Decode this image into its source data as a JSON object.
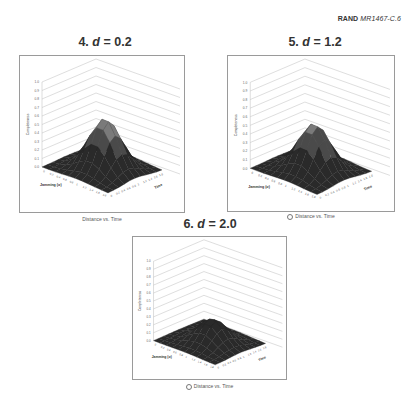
{
  "header": {
    "org": "RAND",
    "doc_id": "MR1467-C.6"
  },
  "panels": [
    {
      "number": "4.",
      "var": "d",
      "eq": " = 0.2",
      "caption": "Distance vs. Time",
      "caption_marker": false
    },
    {
      "number": "5.",
      "var": "d",
      "eq": " = 1.2",
      "caption": "Distance vs. Time",
      "caption_marker": true
    },
    {
      "number": "6.",
      "var": "d",
      "eq": " = 2.0",
      "caption": "Distance vs. Time",
      "caption_marker": true
    }
  ],
  "chart_data": [
    {
      "type": "surface3d",
      "title": "4. d = 0.2",
      "zlabel": "Completeness",
      "xlabel": "Jamming (σ)",
      "ylabel": "Time",
      "legend": "Distance vs. Time",
      "z_ticks": [
        0,
        0.1,
        0.2,
        0.3,
        0.4,
        0.5,
        0.6,
        0.7,
        0.8,
        0.9,
        1
      ],
      "x_ticks": [
        0,
        0.2,
        0.4,
        0.6,
        0.8,
        1,
        1.2,
        1.4,
        1.6,
        1.8
      ],
      "y_ticks": [
        0,
        0.2,
        0.4,
        0.6,
        0.8,
        1,
        1.2,
        1.4,
        1.6,
        1.8
      ],
      "zlim": [
        0,
        1
      ],
      "peak_z": 0.6,
      "shape": "single gaussian-like hill centered mid-domain"
    },
    {
      "type": "surface3d",
      "title": "5. d = 1.2",
      "zlabel": "Completeness",
      "xlabel": "Jamming (σ)",
      "ylabel": "Time",
      "legend": "Distance vs. Time",
      "z_ticks": [
        0,
        0.1,
        0.2,
        0.3,
        0.4,
        0.5,
        0.6,
        0.7,
        0.8,
        0.9,
        1
      ],
      "x_ticks": [
        0,
        0.2,
        0.4,
        0.6,
        0.8,
        1,
        1.2,
        1.4,
        1.6,
        1.8
      ],
      "y_ticks": [
        0,
        0.2,
        0.4,
        0.6,
        0.8,
        1,
        1.2,
        1.4,
        1.6,
        1.8
      ],
      "zlim": [
        0,
        1
      ],
      "peak_z": 0.55,
      "shape": "single gaussian-like hill centered mid-domain"
    },
    {
      "type": "surface3d",
      "title": "6. d = 2.0",
      "zlabel": "Completeness",
      "xlabel": "Jamming (σ)",
      "ylabel": "Time",
      "legend": "Distance vs. Time",
      "z_ticks": [
        0,
        0.1,
        0.2,
        0.3,
        0.4,
        0.5,
        0.6,
        0.7,
        0.8,
        0.9,
        1
      ],
      "x_ticks": [
        0,
        0.2,
        0.4,
        0.6,
        0.8,
        1,
        1.2,
        1.4,
        1.6,
        1.8
      ],
      "y_ticks": [
        0,
        0.2,
        0.4,
        0.6,
        0.8,
        1,
        1.2,
        1.4,
        1.6,
        1.8
      ],
      "zlim": [
        0,
        1
      ],
      "peak_z": 0.3,
      "shape": "single low gaussian-like hill centered mid-domain"
    }
  ],
  "colors": {
    "surface_dark": "#2a2a2a",
    "surface_mid": "#4a4a4a",
    "surface_light": "#7a7a7a",
    "gridline": "#c8c8c8",
    "frame": "#9a9a9a"
  }
}
